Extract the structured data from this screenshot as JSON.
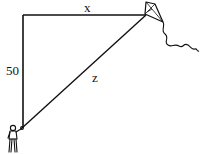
{
  "diagram": {
    "type": "right-triangle-kite-problem",
    "labels": {
      "horizontal": "x",
      "vertical": "50",
      "hypotenuse": "z"
    },
    "colors": {
      "line": "#111111",
      "background": "#ffffff"
    },
    "elements": [
      "kite",
      "kite-tail",
      "person-holding-string",
      "vertical-leg",
      "horizontal-leg",
      "hypotenuse-string"
    ]
  }
}
